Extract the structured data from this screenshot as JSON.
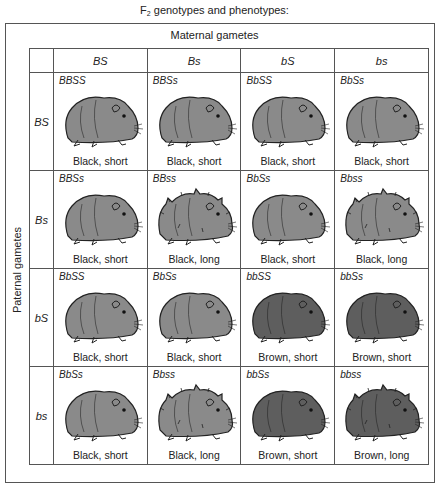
{
  "title": {
    "prefix": "F",
    "subscript": "2",
    "suffix": " genotypes and phenotypes:"
  },
  "maternal_label": "Maternal gametes",
  "paternal_label": "Paternal gametes",
  "maternal_gametes": [
    "BS",
    "Bs",
    "bS",
    "bs"
  ],
  "paternal_gametes": [
    "BS",
    "Bs",
    "bS",
    "bs"
  ],
  "colors": {
    "black_fill": "#8a8a8a",
    "brown_fill": "#5e5e5e",
    "outline": "#222222",
    "border": "#555555"
  },
  "rows": [
    {
      "gamete": "BS",
      "cells": [
        {
          "genotype": "BBSS",
          "phenotype": "Black, short",
          "color": "black",
          "hair": "short"
        },
        {
          "genotype": "BBSs",
          "phenotype": "Black, short",
          "color": "black",
          "hair": "short"
        },
        {
          "genotype": "BbSS",
          "phenotype": "Black, short",
          "color": "black",
          "hair": "short"
        },
        {
          "genotype": "BbSs",
          "phenotype": "Black, short",
          "color": "black",
          "hair": "short"
        }
      ]
    },
    {
      "gamete": "Bs",
      "cells": [
        {
          "genotype": "BBSs",
          "phenotype": "Black, short",
          "color": "black",
          "hair": "short"
        },
        {
          "genotype": "BBss",
          "phenotype": "Black, long",
          "color": "black",
          "hair": "long"
        },
        {
          "genotype": "BbSs",
          "phenotype": "Black, short",
          "color": "black",
          "hair": "short"
        },
        {
          "genotype": "Bbss",
          "phenotype": "Black, long",
          "color": "black",
          "hair": "long"
        }
      ]
    },
    {
      "gamete": "bS",
      "cells": [
        {
          "genotype": "BbSS",
          "phenotype": "Black, short",
          "color": "black",
          "hair": "short"
        },
        {
          "genotype": "BbSs",
          "phenotype": "Black, short",
          "color": "black",
          "hair": "short"
        },
        {
          "genotype": "bbSS",
          "phenotype": "Brown, short",
          "color": "brown",
          "hair": "short"
        },
        {
          "genotype": "bbSs",
          "phenotype": "Brown, short",
          "color": "brown",
          "hair": "short"
        }
      ]
    },
    {
      "gamete": "bs",
      "cells": [
        {
          "genotype": "BbSs",
          "phenotype": "Black, short",
          "color": "black",
          "hair": "short"
        },
        {
          "genotype": "Bbss",
          "phenotype": "Black, long",
          "color": "black",
          "hair": "long"
        },
        {
          "genotype": "bbSs",
          "phenotype": "Brown, short",
          "color": "brown",
          "hair": "short"
        },
        {
          "genotype": "bbss",
          "phenotype": "Brown, long",
          "color": "brown",
          "hair": "long"
        }
      ]
    }
  ]
}
